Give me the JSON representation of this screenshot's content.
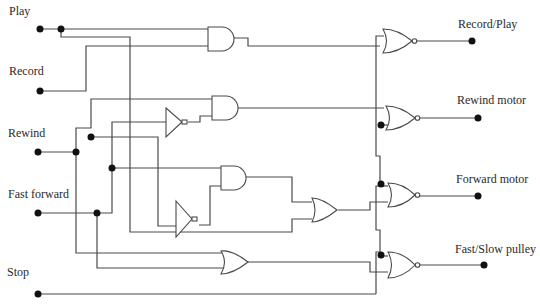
{
  "diagram": {
    "inputs": [
      {
        "id": "play",
        "label": "Play"
      },
      {
        "id": "record",
        "label": "Record"
      },
      {
        "id": "rewind",
        "label": "Rewind"
      },
      {
        "id": "fast_forward",
        "label": "Fast forward"
      },
      {
        "id": "stop",
        "label": "Stop"
      }
    ],
    "outputs": [
      {
        "id": "record_play",
        "label": "Record/Play"
      },
      {
        "id": "rewind_motor",
        "label": "Rewind motor"
      },
      {
        "id": "forward_motor",
        "label": "Forward motor"
      },
      {
        "id": "fast_slow_pulley",
        "label": "Fast/Slow pulley"
      }
    ],
    "gates": [
      {
        "id": "and1",
        "type": "AND",
        "inputs": [
          "Play",
          "Record"
        ]
      },
      {
        "id": "not1",
        "type": "NOT",
        "inputs": [
          "Fast forward"
        ]
      },
      {
        "id": "and2",
        "type": "AND",
        "inputs": [
          "Rewind",
          "NOT Fast forward"
        ]
      },
      {
        "id": "not2",
        "type": "NOT",
        "inputs": [
          "Rewind"
        ]
      },
      {
        "id": "and3",
        "type": "AND",
        "inputs": [
          "Fast forward",
          "NOT Rewind"
        ]
      },
      {
        "id": "or1",
        "type": "OR",
        "inputs": [
          "AND3",
          "Play"
        ]
      },
      {
        "id": "or2",
        "type": "OR",
        "inputs": [
          "Rewind",
          "Fast forward"
        ]
      },
      {
        "id": "nor1",
        "type": "NOR",
        "inputs": [
          "AND1",
          "Stop"
        ],
        "output": "Record/Play"
      },
      {
        "id": "nor2",
        "type": "NOR",
        "inputs": [
          "AND2",
          "Stop"
        ],
        "output": "Rewind motor"
      },
      {
        "id": "nor3",
        "type": "NOR",
        "inputs": [
          "Stop",
          "OR1"
        ],
        "output": "Forward motor"
      },
      {
        "id": "nor4",
        "type": "NOR",
        "inputs": [
          "Stop",
          "OR2"
        ],
        "output": "Fast/Slow pulley"
      }
    ]
  }
}
